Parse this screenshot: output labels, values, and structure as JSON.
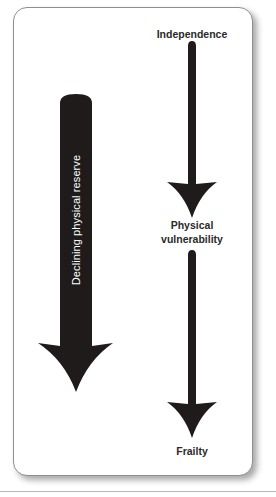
{
  "diagram": {
    "type": "flow",
    "stages": [
      {
        "label": "Independence"
      },
      {
        "label": "Physical vulnerability",
        "lines": [
          "Physical",
          "vulnerability"
        ]
      },
      {
        "label": "Frailty"
      }
    ],
    "side_arrow": {
      "label": "Declining physical reserve",
      "direction": "down"
    },
    "colors": {
      "arrow": "#1e1b1a",
      "text": "#2a2a2a",
      "card_border": "#8f8f8f"
    }
  }
}
